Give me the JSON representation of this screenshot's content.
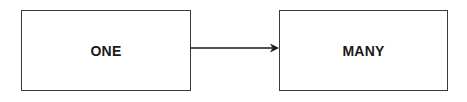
{
  "diagram": {
    "nodes": [
      {
        "id": "one",
        "label": "ONE"
      },
      {
        "id": "many",
        "label": "MANY"
      }
    ],
    "edges": [
      {
        "from": "one",
        "to": "many",
        "type": "arrow"
      }
    ],
    "colors": {
      "stroke": "#3a3a3a",
      "text": "#1a1a1a",
      "background": "#ffffff"
    }
  }
}
